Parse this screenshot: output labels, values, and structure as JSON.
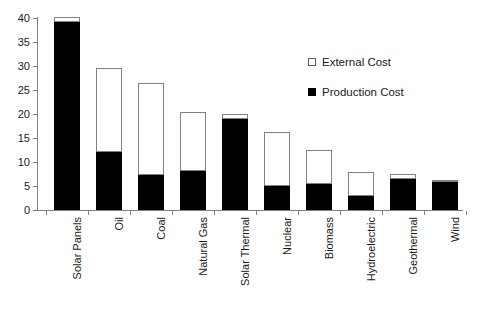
{
  "chart_data": {
    "type": "bar",
    "subtype": "stacked",
    "title": "",
    "subtitle": "",
    "xlabel": "",
    "ylabel": "",
    "ylim": [
      0,
      40
    ],
    "ytick_step": 5,
    "yticks": [
      "40",
      "35",
      "30",
      "25",
      "20",
      "15",
      "10",
      "5",
      "0"
    ],
    "grid": false,
    "legend_position": "upper-right-inside",
    "categories": [
      "Solar Panels",
      "Oil",
      "Coal",
      "Natural Gas",
      "Solar Thermal",
      "Nuclear",
      "Biomass",
      "Hydroelectric",
      "Geothermal",
      "Wind"
    ],
    "series": [
      {
        "name": "Production Cost",
        "color": "#000000",
        "values": [
          39.2,
          12.1,
          7.2,
          8.2,
          19.0,
          4.9,
          5.5,
          2.9,
          6.5,
          5.8
        ]
      },
      {
        "name": "External Cost",
        "color": "#ffffff",
        "values": [
          0.8,
          17.3,
          19.0,
          12.0,
          0.7,
          11.2,
          6.8,
          4.8,
          0.7,
          0.1
        ]
      }
    ],
    "totals": [
      40.0,
      29.4,
      26.2,
      20.2,
      19.7,
      16.1,
      12.3,
      7.7,
      7.2,
      5.9
    ]
  },
  "legend": {
    "entries": [
      {
        "label": "External Cost",
        "swatch": "white-square-icon"
      },
      {
        "label": "Production Cost",
        "swatch": "black-square-icon"
      }
    ]
  }
}
